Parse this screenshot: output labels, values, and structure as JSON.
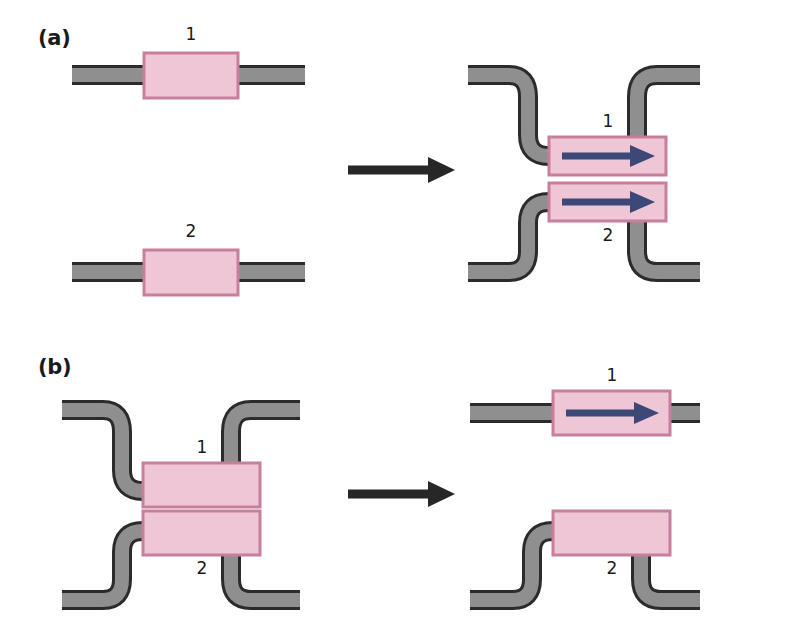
{
  "figure": {
    "background": "#ffffff",
    "width": 787,
    "height": 636
  },
  "colors": {
    "track_fill": "#8f8f8f",
    "track_edge": "#2b2b2b",
    "box_fill": "#eec6d5",
    "box_border": "#c87e9d",
    "arrow_blue": "#3b4878",
    "arrow_black": "#272727",
    "text": "#1a1a1a"
  },
  "panels": [
    {
      "id": "a",
      "label": "(a)",
      "left_state": {
        "name": "separate-straight-tracks",
        "tracks": [
          {
            "id": "a-left-track-1",
            "shape": "straight",
            "box_label": "1",
            "label_position": "above",
            "has_arrow": false
          },
          {
            "id": "a-left-track-2",
            "shape": "straight",
            "box_label": "2",
            "label_position": "above",
            "has_arrow": false
          }
        ]
      },
      "transition": {
        "name": "right-arrow",
        "glyph": "→"
      },
      "right_state": {
        "name": "paired-crossed-tracks",
        "tracks": [
          {
            "id": "a-right-track-1",
            "shape": "s-bend-down-up",
            "box_label": "1",
            "label_position": "above",
            "has_arrow": true,
            "arrow_direction": "right"
          },
          {
            "id": "a-right-track-2",
            "shape": "s-bend-up-down",
            "box_label": "2",
            "label_position": "below",
            "has_arrow": true,
            "arrow_direction": "right"
          }
        ]
      }
    },
    {
      "id": "b",
      "label": "(b)",
      "left_state": {
        "name": "paired-crossed-tracks",
        "tracks": [
          {
            "id": "b-left-track-1",
            "shape": "s-bend-down-up",
            "box_label": "1",
            "label_position": "above",
            "has_arrow": false
          },
          {
            "id": "b-left-track-2",
            "shape": "s-bend-up-down",
            "box_label": "2",
            "label_position": "below",
            "has_arrow": false
          }
        ]
      },
      "transition": {
        "name": "right-arrow",
        "glyph": "→"
      },
      "right_state": {
        "name": "separated-tracks",
        "tracks": [
          {
            "id": "b-right-track-1",
            "shape": "straight",
            "box_label": "1",
            "label_position": "above",
            "has_arrow": true,
            "arrow_direction": "right"
          },
          {
            "id": "b-right-track-2",
            "shape": "bump-up",
            "box_label": "2",
            "label_position": "below",
            "has_arrow": false
          }
        ]
      }
    }
  ],
  "labels": {
    "panel_a": "(a)",
    "panel_b": "(b)",
    "a_left_box1": "1",
    "a_left_box2": "2",
    "a_right_box1": "1",
    "a_right_box2": "2",
    "b_left_box1": "1",
    "b_left_box2": "2",
    "b_right_box1": "1",
    "b_right_box2": "2"
  }
}
